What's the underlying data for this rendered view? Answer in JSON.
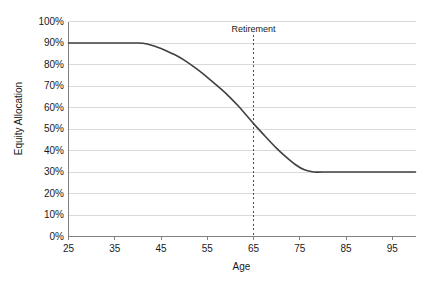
{
  "chart_data": {
    "type": "line",
    "title": "",
    "xlabel": "Age",
    "ylabel": "Equity Allocation",
    "xlim": [
      25,
      100
    ],
    "ylim": [
      0,
      1
    ],
    "grid": true,
    "legend": null,
    "x_ticks": [
      25,
      35,
      45,
      55,
      65,
      75,
      85,
      95
    ],
    "x_tick_labels": [
      "25",
      "35",
      "45",
      "55",
      "65",
      "75",
      "85",
      "95"
    ],
    "y_ticks": [
      0,
      0.1,
      0.2,
      0.3,
      0.4,
      0.5,
      0.6,
      0.7,
      0.8,
      0.9,
      1.0
    ],
    "y_tick_labels": [
      "0%",
      "10%",
      "20%",
      "30%",
      "40%",
      "50%",
      "60%",
      "70%",
      "80%",
      "90%",
      "100%"
    ],
    "series": [
      {
        "name": "Equity Allocation Glide Path",
        "color": "#404040",
        "x": [
          25,
          30,
          35,
          40,
          42,
          45,
          48,
          50,
          53,
          55,
          58,
          60,
          62,
          65,
          68,
          70,
          72,
          74,
          76,
          78,
          80,
          85,
          90,
          95,
          100
        ],
        "values": [
          0.9,
          0.9,
          0.9,
          0.9,
          0.895,
          0.875,
          0.845,
          0.82,
          0.775,
          0.74,
          0.685,
          0.645,
          0.6,
          0.525,
          0.455,
          0.41,
          0.37,
          0.335,
          0.31,
          0.3,
          0.3,
          0.3,
          0.3,
          0.3,
          0.3
        ]
      }
    ],
    "annotations": [
      {
        "label": "Retirement",
        "x": 65,
        "style": "dashed-vertical-line",
        "color": "#4d4d4d",
        "label_y": 0.96
      }
    ]
  },
  "style": {
    "plot_bg": "#ffffff",
    "grid_color": "#d9d9d9",
    "axis_color": "#808080",
    "text_color": "#1a1a1a",
    "line_color": "#404040"
  }
}
